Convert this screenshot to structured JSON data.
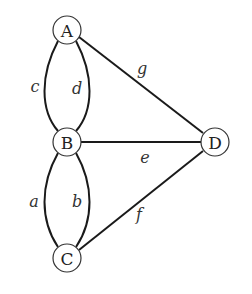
{
  "diagram": {
    "type": "multigraph",
    "nodes": [
      {
        "id": "A",
        "label": "A",
        "x": 67,
        "y": 30
      },
      {
        "id": "B",
        "label": "B",
        "x": 67,
        "y": 142
      },
      {
        "id": "C",
        "label": "C",
        "x": 67,
        "y": 258
      },
      {
        "id": "D",
        "label": "D",
        "x": 215,
        "y": 142
      }
    ],
    "edges": [
      {
        "id": "a",
        "label": "a",
        "from": "B",
        "to": "C"
      },
      {
        "id": "b",
        "label": "b",
        "from": "B",
        "to": "C"
      },
      {
        "id": "c",
        "label": "c",
        "from": "A",
        "to": "B"
      },
      {
        "id": "d",
        "label": "d",
        "from": "A",
        "to": "B"
      },
      {
        "id": "e",
        "label": "e",
        "from": "B",
        "to": "D"
      },
      {
        "id": "f",
        "label": "f",
        "from": "C",
        "to": "D"
      },
      {
        "id": "g",
        "label": "g",
        "from": "A",
        "to": "D"
      }
    ]
  },
  "labels": {
    "node_A": "A",
    "node_B": "B",
    "node_C": "C",
    "node_D": "D",
    "edge_a": "a",
    "edge_b": "b",
    "edge_c": "c",
    "edge_d": "d",
    "edge_e": "e",
    "edge_f": "f",
    "edge_g": "g"
  }
}
